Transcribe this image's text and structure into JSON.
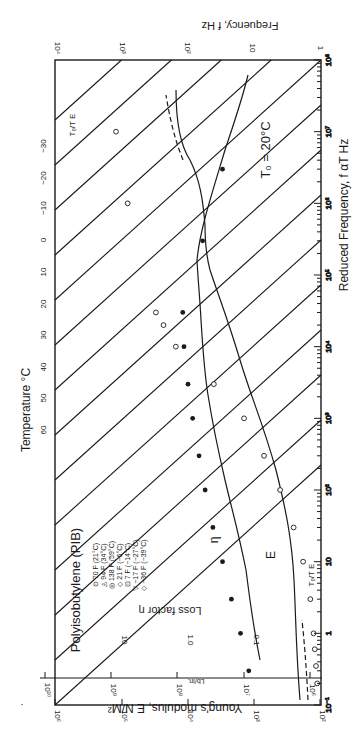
{
  "chart_data": {
    "type": "scatter",
    "orientation": "rotated 90 degrees clockwise on the page",
    "title": "Polyisobutylene (PIB)",
    "annotation_reference_temperature": "T₀ = 20°C",
    "xlabel": "Reduced Frequency, f αT Hz",
    "x_scale": "log",
    "xlim": [
      0.1,
      100000000
    ],
    "x_ticks": [
      "10⁻¹",
      "1",
      "10",
      "10²",
      "10³",
      "10⁴",
      "10⁵",
      "10⁶",
      "10⁷",
      "10⁸"
    ],
    "ylabel": "Young's modulus, E N/M²",
    "y_scale": "log",
    "ylim": [
      1000000,
      10000000000
    ],
    "y_ticks": [
      "10⁶",
      "10⁷",
      "10⁸",
      "10⁹",
      "10¹⁰"
    ],
    "y2label": "Lb/in.",
    "y2_ticks": [
      "10²",
      "10³",
      "10⁴",
      "10⁵",
      "10⁶"
    ],
    "loss_factor_label": "Loss factor η",
    "loss_factor_ticks": [
      "0.1",
      "1.0",
      "10"
    ],
    "top_axis_label": "Frequency, f Hz",
    "top_axis_ticks": [
      "1",
      "10",
      "10²",
      "10³",
      "10⁴"
    ],
    "temperature_axis_label": "Temperature °C",
    "temperature_ticks": [
      "60",
      "50",
      "40",
      "30",
      "20",
      "10",
      "0",
      "−10",
      "−20",
      "−30"
    ],
    "curve_labels": {
      "modulus": "E",
      "loss": "η",
      "low_end": "T₀/T E",
      "high_end": "T₀/T E"
    },
    "legend": [
      {
        "symbol": "⊙",
        "label": "70 F (21°C)"
      },
      {
        "symbol": "◬",
        "label": "94 F (34°C)"
      },
      {
        "symbol": "◎",
        "label": "138 F (59°C)"
      },
      {
        "symbol": "◇",
        "label": "21 F (−6°C)"
      },
      {
        "symbol": "⊡",
        "label": "7 F (−14°C)"
      },
      {
        "symbol": "▽",
        "label": "−17 F (−27°C)"
      },
      {
        "symbol": "◇",
        "label": "−36 F (−39°C)"
      }
    ],
    "series": [
      {
        "name": "Young's modulus E (open symbols)",
        "x": [
          0.2,
          0.35,
          0.6,
          1,
          3,
          10,
          30,
          100,
          300,
          1000,
          3000,
          10000,
          20000,
          30000,
          1000000,
          10000000
        ],
        "y": [
          1100000,
          1150000,
          1200000,
          1250000,
          1400000,
          1800000,
          2500000,
          4000000,
          7000000,
          14000000,
          40000000,
          150000000,
          230000000,
          300000000,
          800000000,
          1200000000
        ]
      },
      {
        "name": "Loss factor η (filled symbols)",
        "x": [
          0.3,
          1,
          3,
          10,
          30,
          100,
          300,
          1000,
          3000,
          10000,
          30000,
          300000,
          3000000
        ],
        "y": [
          0.12,
          0.16,
          0.22,
          0.3,
          0.42,
          0.55,
          0.68,
          0.85,
          1.0,
          1.15,
          1.2,
          0.6,
          0.3
        ]
      }
    ],
    "grid": "diagonal isotherm lines (temperature shift lines)",
    "legend_position": "upper-left (rotated)"
  }
}
